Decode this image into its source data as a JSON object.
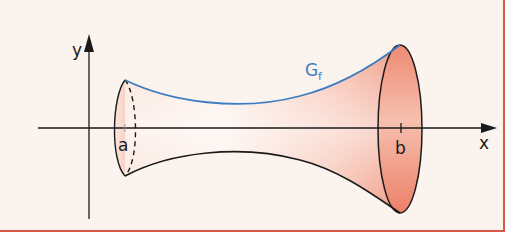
{
  "figure": {
    "colors": {
      "background": "#fbf3ee",
      "frame_border": "#d9584a",
      "curve": "#3d7cc0",
      "solid_fill_light": "#fdebe3",
      "solid_fill_dark": "#ee8a74",
      "axis": "#1a1a1a"
    },
    "axes": {
      "x_label": "x",
      "y_label": "y"
    },
    "bounds": {
      "left_label": "a",
      "right_label": "b"
    },
    "graph": {
      "label_main": "G",
      "label_sub": "f"
    }
  }
}
